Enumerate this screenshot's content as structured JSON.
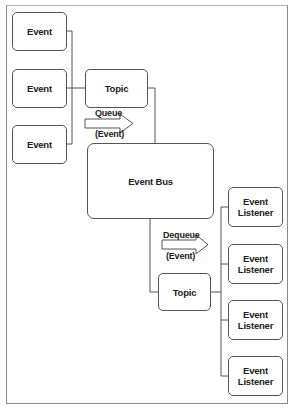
{
  "diagram": {
    "type": "event-bus-architecture",
    "producers": [
      {
        "label": "Event"
      },
      {
        "label": "Event"
      },
      {
        "label": "Event"
      }
    ],
    "topic_in": {
      "label": "Topic"
    },
    "queue_arrow": {
      "line1": "Queue",
      "line2": "(Event)"
    },
    "bus": {
      "label": "Event Bus"
    },
    "dequeue_arrow": {
      "line1": "Dequeue",
      "line2": "(Event)"
    },
    "topic_out": {
      "label": "Topic"
    },
    "listeners": [
      {
        "line1": "Event",
        "line2": "Listener"
      },
      {
        "line1": "Event",
        "line2": "Listener"
      },
      {
        "line1": "Event",
        "line2": "Listener"
      },
      {
        "line1": "Event",
        "line2": "Listener"
      }
    ],
    "colors": {
      "stroke": "#555555",
      "text": "#222222",
      "frame": "#8a8a8a",
      "background": "#ffffff"
    }
  }
}
